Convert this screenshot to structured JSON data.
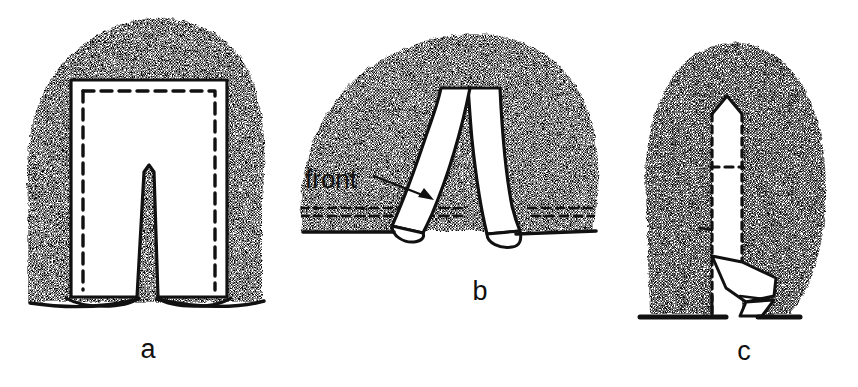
{
  "figure": {
    "kind": "line-diagram",
    "background_color": "#ffffff",
    "ink_color": "#111111",
    "stipple_color": "#111111",
    "width": 858,
    "height": 387
  },
  "panels": [
    {
      "id": "a",
      "label": "a",
      "label_x": 148,
      "label_y": 358,
      "description": "trousers laid flat on fabric, solid outline with inner dashed stitching line and centre crotch notch"
    },
    {
      "id": "b",
      "label": "b",
      "label_x": 480,
      "label_y": 300,
      "description": "trousers with legs crossed over one another on fabric"
    },
    {
      "id": "c",
      "label": "c",
      "label_x": 744,
      "label_y": 360,
      "description": "narrow folded column with pointed top and diagonal fold-out flap"
    }
  ],
  "callouts": [
    {
      "id": "front",
      "text": "front",
      "text_x": 305,
      "text_y": 188,
      "arrow_from_x": 388,
      "arrow_from_y": 176,
      "arrow_to_x": 432,
      "arrow_to_y": 199
    }
  ]
}
